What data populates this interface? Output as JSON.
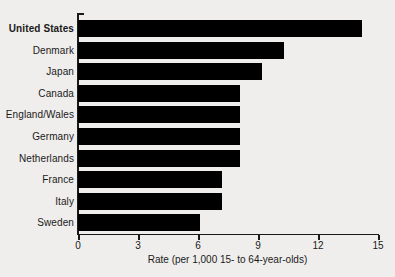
{
  "chart_data": {
    "type": "bar",
    "orientation": "horizontal",
    "title": "",
    "xlabel": "Rate (per 1,000 15- to 64-year-olds)",
    "ylabel": "",
    "xlim": [
      0,
      15
    ],
    "xticks": [
      "0",
      "3",
      "6",
      "9",
      "12",
      "15"
    ],
    "grid": false,
    "legend": "none",
    "bar_color": "#000000",
    "background_color": "#efeeec",
    "axis_color": "#1a1a1a",
    "emphasis_category": "United States",
    "categories": [
      "United States",
      "Denmark",
      "Japan",
      "Canada",
      "England/Wales",
      "Germany",
      "Netherlands",
      "France",
      "Italy",
      "Sweden"
    ],
    "values": [
      14.2,
      10.3,
      9.2,
      8.1,
      8.1,
      8.1,
      8.1,
      7.2,
      7.2,
      6.1
    ]
  }
}
